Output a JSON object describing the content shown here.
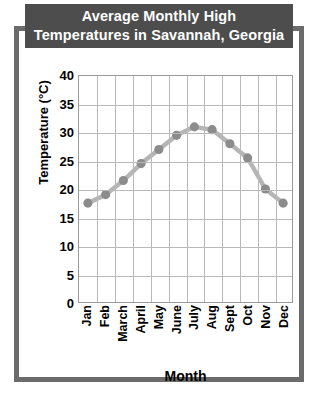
{
  "figure": {
    "title_line1": "Average Monthly High",
    "title_line2": "Temperatures in Savannah, Georgia",
    "banner_color": "#4d4d4d",
    "frame_color": "#6b6b6b",
    "background_color": "#ffffff"
  },
  "chart_data": {
    "type": "line",
    "title": "Average Monthly High Temperatures in Savannah, Georgia",
    "subtitle": "",
    "xlabel": "Month",
    "ylabel": "Temperature (°C)",
    "categories": [
      "Jan",
      "Feb",
      "March",
      "April",
      "May",
      "June",
      "July",
      "Aug",
      "Sept",
      "Oct",
      "Nov",
      "Dec"
    ],
    "values": [
      17.5,
      19,
      21.5,
      24.5,
      27,
      29.5,
      31,
      30.5,
      28,
      25.5,
      20,
      17.5
    ],
    "ylim": [
      0,
      40
    ],
    "ytick_step": 5,
    "yticks": [
      "40",
      "35",
      "30",
      "25",
      "20",
      "15",
      "10",
      "5",
      "0"
    ],
    "grid": true,
    "legend": "none",
    "series_color": "#8c8c8c",
    "line_color": "#b5b5b5",
    "marker": "circle"
  }
}
